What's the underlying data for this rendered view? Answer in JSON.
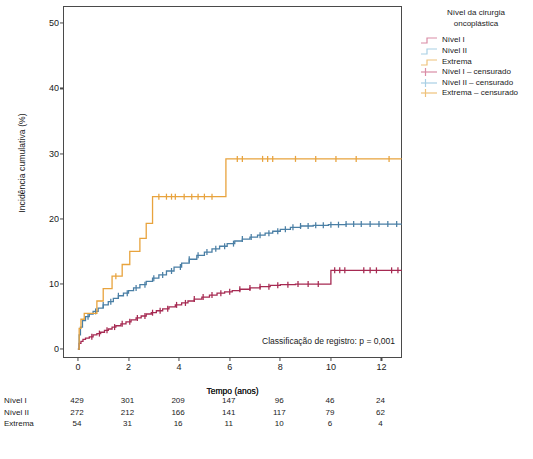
{
  "chart_data": {
    "type": "line",
    "title": "",
    "xlabel": "Tempo (anos)",
    "ylabel": "Incidência cumulativa (%)",
    "xlim": [
      -0.55,
      12.85
    ],
    "ylim": [
      -1.5,
      52.5
    ],
    "xticks": [
      "0",
      "2",
      "4",
      "6",
      "8",
      "10",
      "12"
    ],
    "xtick_values": [
      0,
      2,
      4,
      6,
      8,
      10,
      12
    ],
    "yticks": [
      "0",
      "10",
      "20",
      "30",
      "40",
      "50"
    ],
    "ytick_values": [
      0,
      10,
      20,
      30,
      40,
      50
    ],
    "grid": false,
    "legend_position": "right",
    "annotation": "Classificação de registro: p = 0,001",
    "series": [
      {
        "name": "Nível I",
        "color": "#a62a52",
        "final_value": 12.1,
        "points": [
          [
            0,
            0
          ],
          [
            0.05,
            0.9
          ],
          [
            0.12,
            1.2
          ],
          [
            0.2,
            1.5
          ],
          [
            0.3,
            1.7
          ],
          [
            0.45,
            1.9
          ],
          [
            0.6,
            2.2
          ],
          [
            0.75,
            2.4
          ],
          [
            0.9,
            2.6
          ],
          [
            1.05,
            2.9
          ],
          [
            1.2,
            3.1
          ],
          [
            1.35,
            3.4
          ],
          [
            1.5,
            3.6
          ],
          [
            1.7,
            3.9
          ],
          [
            1.9,
            4.2
          ],
          [
            2.1,
            4.5
          ],
          [
            2.3,
            4.8
          ],
          [
            2.5,
            5.1
          ],
          [
            2.7,
            5.4
          ],
          [
            2.9,
            5.6
          ],
          [
            3.1,
            5.9
          ],
          [
            3.35,
            6.2
          ],
          [
            3.6,
            6.5
          ],
          [
            3.85,
            6.8
          ],
          [
            4.1,
            7.1
          ],
          [
            4.35,
            7.4
          ],
          [
            4.6,
            7.7
          ],
          [
            4.9,
            8.0
          ],
          [
            5.2,
            8.3
          ],
          [
            5.5,
            8.6
          ],
          [
            5.8,
            8.8
          ],
          [
            6.1,
            9.0
          ],
          [
            6.4,
            9.2
          ],
          [
            6.8,
            9.4
          ],
          [
            7.2,
            9.6
          ],
          [
            7.6,
            9.8
          ],
          [
            8.0,
            9.9
          ],
          [
            8.6,
            10.0
          ],
          [
            9.2,
            10.0
          ],
          [
            9.9,
            10.0
          ],
          [
            10.0,
            12.1
          ],
          [
            10.6,
            12.1
          ],
          [
            11.4,
            12.1
          ],
          [
            12.2,
            12.1
          ],
          [
            12.8,
            12.1
          ]
        ],
        "censor_marks": [
          0.55,
          0.85,
          1.15,
          1.45,
          1.75,
          2.05,
          2.35,
          2.65,
          2.95,
          3.25,
          3.55,
          3.9,
          4.25,
          4.6,
          4.95,
          5.3,
          5.65,
          6.0,
          6.4,
          6.8,
          7.2,
          7.55,
          7.9,
          8.3,
          8.7,
          9.1,
          9.5,
          10.15,
          10.35,
          10.55,
          11.3,
          11.55,
          11.8,
          12.4,
          12.65
        ]
      },
      {
        "name": "Nível II",
        "color": "#4a7fa5",
        "final_value": 19.2,
        "points": [
          [
            0,
            0
          ],
          [
            0.05,
            2.2
          ],
          [
            0.1,
            3.4
          ],
          [
            0.18,
            4.4
          ],
          [
            0.3,
            5.0
          ],
          [
            0.45,
            5.4
          ],
          [
            0.6,
            5.8
          ],
          [
            0.8,
            6.3
          ],
          [
            1.0,
            6.8
          ],
          [
            1.2,
            7.3
          ],
          [
            1.4,
            7.8
          ],
          [
            1.6,
            8.2
          ],
          [
            1.8,
            8.6
          ],
          [
            2.0,
            9.0
          ],
          [
            2.2,
            9.4
          ],
          [
            2.45,
            9.9
          ],
          [
            2.7,
            10.4
          ],
          [
            2.95,
            10.9
          ],
          [
            3.2,
            11.4
          ],
          [
            3.5,
            12.0
          ],
          [
            3.8,
            12.6
          ],
          [
            4.1,
            13.2
          ],
          [
            4.4,
            13.8
          ],
          [
            4.7,
            14.4
          ],
          [
            5.0,
            14.9
          ],
          [
            5.3,
            15.4
          ],
          [
            5.6,
            15.8
          ],
          [
            5.9,
            16.2
          ],
          [
            6.2,
            16.6
          ],
          [
            6.5,
            16.9
          ],
          [
            6.8,
            17.2
          ],
          [
            7.1,
            17.5
          ],
          [
            7.4,
            17.8
          ],
          [
            7.7,
            18.1
          ],
          [
            8.0,
            18.4
          ],
          [
            8.4,
            18.7
          ],
          [
            8.8,
            18.9
          ],
          [
            9.3,
            19.0
          ],
          [
            9.9,
            19.1
          ],
          [
            10.6,
            19.2
          ],
          [
            11.5,
            19.2
          ],
          [
            12.4,
            19.2
          ],
          [
            12.8,
            19.2
          ]
        ],
        "censor_marks": [
          0.4,
          0.7,
          1.0,
          1.3,
          1.6,
          1.95,
          2.3,
          2.65,
          3.0,
          3.35,
          3.7,
          4.05,
          4.4,
          4.75,
          5.1,
          5.45,
          5.8,
          6.15,
          6.5,
          6.85,
          7.2,
          7.55,
          7.9,
          8.2,
          8.5,
          8.8,
          9.1,
          9.4,
          9.7,
          10.0,
          10.3,
          10.6,
          10.9,
          11.2,
          11.55,
          11.9,
          12.25,
          12.6
        ]
      },
      {
        "name": "Extrema",
        "color": "#e8a33d",
        "final_value": 29.2,
        "points": [
          [
            0,
            0
          ],
          [
            0.05,
            3.2
          ],
          [
            0.12,
            4.6
          ],
          [
            0.25,
            5.5
          ],
          [
            0.5,
            5.5
          ],
          [
            0.75,
            7.4
          ],
          [
            0.9,
            7.4
          ],
          [
            1.0,
            9.3
          ],
          [
            1.2,
            9.3
          ],
          [
            1.35,
            11.2
          ],
          [
            1.6,
            11.2
          ],
          [
            1.75,
            13.0
          ],
          [
            1.95,
            13.0
          ],
          [
            2.05,
            15.0
          ],
          [
            2.35,
            15.0
          ],
          [
            2.45,
            17.0
          ],
          [
            2.6,
            17.0
          ],
          [
            2.7,
            19.3
          ],
          [
            2.85,
            19.3
          ],
          [
            2.95,
            23.4
          ],
          [
            5.75,
            23.4
          ],
          [
            5.85,
            29.2
          ],
          [
            7.0,
            29.2
          ],
          [
            9.0,
            29.2
          ],
          [
            11.0,
            29.2
          ],
          [
            12.8,
            29.2
          ]
        ],
        "censor_marks": [
          1.5,
          3.2,
          3.5,
          3.7,
          3.85,
          4.2,
          4.5,
          4.75,
          5.0,
          5.3,
          6.3,
          6.5,
          7.3,
          7.5,
          7.7,
          8.6,
          9.4,
          10.2,
          11.0,
          12.3
        ]
      }
    ],
    "risk_table": {
      "header": "Tempo (anos)",
      "times": [
        0,
        2,
        4,
        6,
        8,
        10,
        12
      ],
      "rows": [
        {
          "label": "Nível I",
          "values": [
            "429",
            "301",
            "209",
            "147",
            "96",
            "46",
            "24"
          ]
        },
        {
          "label": "Nível II",
          "values": [
            "272",
            "212",
            "166",
            "141",
            "117",
            "79",
            "62"
          ]
        },
        {
          "label": "Extrema",
          "values": [
            "54",
            "31",
            "16",
            "11",
            "10",
            "6",
            "4"
          ]
        }
      ]
    }
  },
  "legend": {
    "title_line1": "Nível da cirurgia",
    "title_line2": "oncoplástica",
    "entries": [
      {
        "label": "Nível I",
        "color": "#d98ba5",
        "marker": "step"
      },
      {
        "label": "Nível II",
        "color": "#a8cfe4",
        "marker": "step"
      },
      {
        "label": "Extrema",
        "color": "#eec27a",
        "marker": "step"
      },
      {
        "label": "Nível I – censurado",
        "color": "#d98ba5",
        "marker": "plus"
      },
      {
        "label": "Nível II – censurado",
        "color": "#a8cfe4",
        "marker": "plus"
      },
      {
        "label": "Extrema – censurado",
        "color": "#eec27a",
        "marker": "plus"
      }
    ]
  },
  "caption": {
    "text": ""
  }
}
